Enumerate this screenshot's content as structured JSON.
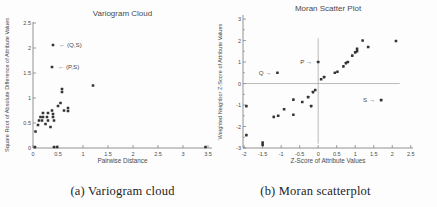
{
  "figure": {
    "captions": [
      {
        "label": "(a) Variogram cloud"
      },
      {
        "label": "(b) Moran scatterplot"
      }
    ]
  },
  "colors": {
    "point": "#333333",
    "axis": "#777777",
    "refline": "#aaaaaa",
    "title_text": "#3a3a3a",
    "tick_text": "#555555"
  },
  "chart_data": [
    {
      "type": "scatter",
      "title": "Variogram Cloud",
      "xlabel": "Pairwise Distance",
      "ylabel": "Square Root of Absolute Difference of Attribute Values",
      "xlim": [
        0,
        3.58
      ],
      "ylim": [
        0,
        2.52
      ],
      "xticks": [
        0,
        0.5,
        1,
        1.5,
        2,
        2.5,
        3,
        3.5
      ],
      "yticks": [
        0,
        0.5,
        1,
        1.5,
        2,
        2.5
      ],
      "yminor": [],
      "grid": false,
      "legend": null,
      "points": [
        [
          0.05,
          0.33
        ],
        [
          0.1,
          0.46
        ],
        [
          0.12,
          0.55
        ],
        [
          0.15,
          0.62
        ],
        [
          0.18,
          0.55
        ],
        [
          0.2,
          0.7
        ],
        [
          0.2,
          0.62
        ],
        [
          0.25,
          0.48
        ],
        [
          0.28,
          0.62
        ],
        [
          0.3,
          0.7
        ],
        [
          0.3,
          0.55
        ],
        [
          0.35,
          0.42
        ],
        [
          0.38,
          0.75
        ],
        [
          0.4,
          0.68
        ],
        [
          0.4,
          0.62
        ],
        [
          0.42,
          0.55
        ],
        [
          0.5,
          0.84
        ],
        [
          0.55,
          0.9
        ],
        [
          0.58,
          1.18
        ],
        [
          0.58,
          1.12
        ],
        [
          0.62,
          0.75
        ],
        [
          0.7,
          0.8
        ],
        [
          0.7,
          0.74
        ],
        [
          1.2,
          1.25
        ],
        [
          0.4,
          2.06
        ],
        [
          0.38,
          1.62
        ],
        [
          0.04,
          0.02
        ],
        [
          0.42,
          0.02
        ],
        [
          0.48,
          0.02
        ],
        [
          3.45,
          0.02
        ]
      ],
      "annotations": [
        {
          "text": "← (Q,S)",
          "x": 0.4,
          "y": 2.06,
          "side": "right"
        },
        {
          "text": "← (P,S)",
          "x": 0.38,
          "y": 1.62,
          "side": "right"
        }
      ],
      "reflines": []
    },
    {
      "type": "scatter",
      "title": "Moran Scatter Plot",
      "xlabel": "Z-Score of Attribute Values",
      "ylabel": "Weighted Neighbor Z-Score of Attribute Values",
      "xlim": [
        -2.03,
        2.56
      ],
      "ylim": [
        -3.0,
        3.19
      ],
      "xticks": [
        -2,
        -1.5,
        -1,
        -0.5,
        0,
        0.5,
        1,
        1.5,
        2,
        2.5
      ],
      "yticks": [
        -3,
        -2,
        -1,
        0,
        1,
        2,
        3
      ],
      "yminor": [
        -2.5,
        -1.5,
        -0.5,
        0.5,
        1.5,
        2.5
      ],
      "grid": false,
      "legend": null,
      "points": [
        [
          -1.94,
          -1.05
        ],
        [
          -1.94,
          -2.4
        ],
        [
          -1.5,
          -2.75
        ],
        [
          -1.5,
          -2.86
        ],
        [
          -1.2,
          -1.55
        ],
        [
          -1.08,
          -1.5
        ],
        [
          -0.92,
          -1.2
        ],
        [
          -0.67,
          -1.45
        ],
        [
          -0.67,
          -0.75
        ],
        [
          -0.43,
          -0.86
        ],
        [
          -0.27,
          -0.63
        ],
        [
          -0.19,
          -1.05
        ],
        [
          -0.14,
          -0.4
        ],
        [
          -0.08,
          -0.3
        ],
        [
          0.08,
          0.2
        ],
        [
          0.16,
          0.3
        ],
        [
          0.45,
          0.5
        ],
        [
          0.52,
          0.55
        ],
        [
          0.68,
          0.8
        ],
        [
          0.75,
          0.95
        ],
        [
          0.8,
          1.0
        ],
        [
          0.92,
          1.3
        ],
        [
          1.0,
          1.45
        ],
        [
          1.05,
          1.5
        ],
        [
          1.05,
          1.62
        ],
        [
          1.2,
          2.0
        ],
        [
          1.35,
          1.7
        ],
        [
          2.1,
          1.98
        ],
        [
          -1.1,
          0.5
        ],
        [
          0.0,
          1.0
        ],
        [
          1.7,
          -0.77
        ]
      ],
      "annotations": [
        {
          "text": "Q →",
          "x": -1.1,
          "y": 0.5,
          "side": "left"
        },
        {
          "text": "P →",
          "x": 0.0,
          "y": 1.0,
          "side": "left"
        },
        {
          "text": "S →",
          "x": 1.7,
          "y": -0.77,
          "side": "left"
        }
      ],
      "reflines": [
        {
          "orient": "h",
          "at": 0,
          "from": -1.97,
          "to": 2.2
        },
        {
          "orient": "v",
          "at": 0,
          "from": -2.8,
          "to": 2.1
        }
      ]
    }
  ]
}
